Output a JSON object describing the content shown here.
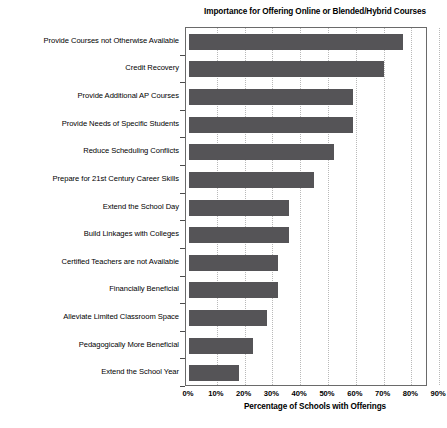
{
  "chart_data": {
    "type": "bar",
    "orientation": "horizontal",
    "title": "Importance for Offering Online or Blended/Hybrid Courses",
    "xlabel": "Percentage of Schools with Offerings",
    "ylabel": "",
    "xlim": [
      0,
      90
    ],
    "xtick_labels": [
      "0%",
      "10%",
      "20%",
      "30%",
      "40%",
      "50%",
      "60%",
      "70%",
      "80%",
      "90%"
    ],
    "xtick_values": [
      0,
      10,
      20,
      30,
      40,
      50,
      60,
      70,
      80,
      90
    ],
    "grid": true,
    "grid_axis": "x",
    "legend": false,
    "bar_color": "#555457",
    "categories": [
      "Provide Courses not Otherwise Available",
      "Credit Recovery",
      "Provide Additional AP Courses",
      "Provide Needs of Specific Students",
      "Reduce Scheduling Conflicts",
      "Prepare for 21st Century Career Skills",
      "Extend the School Day",
      "Build Linkages with Colleges",
      "Certified Teachers are not Available",
      "Financially Beneficial",
      "Alleviate Limited Classroom Space",
      "Pedagogically More Beneficial",
      "Extend the School Year"
    ],
    "values": [
      77,
      70,
      59,
      59,
      52,
      45,
      36,
      36,
      32,
      32,
      28,
      23,
      18
    ]
  }
}
